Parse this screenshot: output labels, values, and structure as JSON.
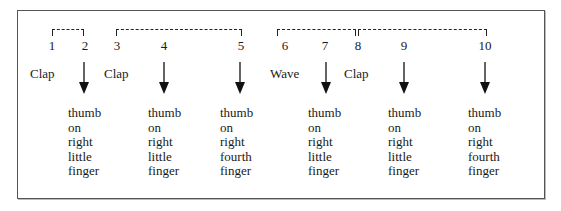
{
  "diagram": {
    "brackets": [
      {
        "from": 1,
        "to": 2,
        "left": 52,
        "width": 32
      },
      {
        "from": 3,
        "to": 5,
        "left": 116,
        "width": 126
      },
      {
        "from": 6,
        "to": 7,
        "left": 277,
        "width": 79
      },
      {
        "from": 8,
        "to": 10,
        "left": 358,
        "width": 129
      }
    ],
    "beats": [
      {
        "n": "1",
        "x": 52
      },
      {
        "n": "2",
        "x": 85
      },
      {
        "n": "3",
        "x": 117
      },
      {
        "n": "4",
        "x": 164
      },
      {
        "n": "5",
        "x": 241
      },
      {
        "n": "6",
        "x": 285
      },
      {
        "n": "7",
        "x": 325
      },
      {
        "n": "8",
        "x": 358
      },
      {
        "n": "9",
        "x": 404
      },
      {
        "n": "10",
        "x": 485
      }
    ],
    "actions": [
      {
        "label": "Clap",
        "x": 30
      },
      {
        "label": "Clap",
        "x": 104
      },
      {
        "label": "Wave",
        "x": 270
      },
      {
        "label": "Clap",
        "x": 344
      }
    ],
    "arrows": [
      {
        "x": 84
      },
      {
        "x": 164
      },
      {
        "x": 240
      },
      {
        "x": 326
      },
      {
        "x": 404
      },
      {
        "x": 485
      }
    ],
    "descriptions": [
      {
        "x": 68,
        "lines": [
          "thumb",
          "on",
          "right",
          "little",
          "finger"
        ]
      },
      {
        "x": 148,
        "lines": [
          "thumb",
          "on",
          "right",
          "little",
          "finger"
        ]
      },
      {
        "x": 220,
        "lines": [
          "thumb",
          "on",
          "right",
          "fourth",
          "finger"
        ]
      },
      {
        "x": 308,
        "lines": [
          "thumb",
          "on",
          "right",
          "little",
          "finger"
        ]
      },
      {
        "x": 388,
        "lines": [
          "thumb",
          "on",
          "right",
          "little",
          "finger"
        ]
      },
      {
        "x": 468,
        "lines": [
          "thumb",
          "on",
          "right",
          "fourth",
          "finger"
        ]
      }
    ]
  }
}
